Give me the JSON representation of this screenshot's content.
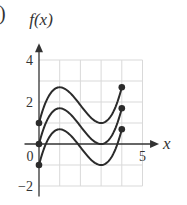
{
  "panel_label": ")",
  "chart_data": {
    "type": "line",
    "title": "",
    "ylabel": "f(x)",
    "xlabel": "x",
    "xlim": [
      -0.7,
      5.8
    ],
    "ylim": [
      -2.5,
      4.8
    ],
    "grid": true,
    "grid_x_range": [
      0,
      5
    ],
    "grid_y_range": [
      -2,
      4
    ],
    "x_ticks": [
      {
        "value": 0,
        "label": "0"
      },
      {
        "value": 5,
        "label": "5"
      }
    ],
    "y_ticks": [
      {
        "value": 4,
        "label": "4"
      },
      {
        "value": 2,
        "label": "2"
      },
      {
        "value": -2,
        "label": "−2"
      }
    ],
    "function": "f(x) = 0.425*x*(x-3)^2 + c",
    "domain": [
      0,
      4
    ],
    "series": [
      {
        "name": "upper",
        "shift": 1,
        "points": [
          [
            0,
            1
          ],
          [
            1,
            2.7
          ],
          [
            2,
            1.85
          ],
          [
            3,
            1
          ],
          [
            4,
            2.7
          ]
        ],
        "endpoints": [
          [
            0,
            1
          ],
          [
            4,
            2.7
          ]
        ]
      },
      {
        "name": "middle",
        "shift": 0,
        "points": [
          [
            0,
            0
          ],
          [
            1,
            1.7
          ],
          [
            2,
            0.85
          ],
          [
            3,
            0
          ],
          [
            4,
            1.7
          ]
        ],
        "endpoints": [
          [
            0,
            0
          ],
          [
            4,
            1.7
          ]
        ]
      },
      {
        "name": "lower",
        "shift": -1,
        "points": [
          [
            0,
            -1
          ],
          [
            1,
            0.7
          ],
          [
            2,
            -0.15
          ],
          [
            3,
            -1
          ],
          [
            4,
            0.7
          ]
        ],
        "endpoints": [
          [
            0,
            -1
          ],
          [
            4,
            0.7
          ]
        ]
      }
    ],
    "colors": {
      "curve": "#2b2b2b",
      "axis": "#333333",
      "grid": "#d9d9d9"
    }
  }
}
